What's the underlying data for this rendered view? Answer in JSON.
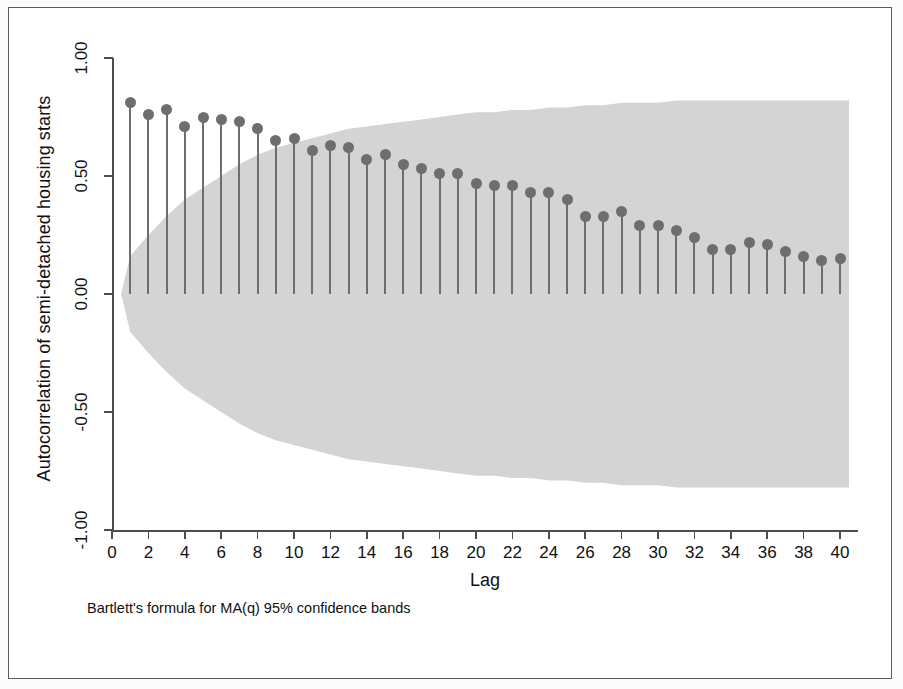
{
  "chart_data": {
    "type": "bar",
    "title": "",
    "xlabel": "Lag",
    "ylabel": "Autocorrelation of semi-detached housing starts",
    "note": "Bartlett's formula for MA(q) 95% confidence bands",
    "xlim": [
      0,
      41
    ],
    "ylim": [
      -1.0,
      1.0
    ],
    "grid": false,
    "legend": "none",
    "xticks": [
      0,
      2,
      4,
      6,
      8,
      10,
      12,
      14,
      16,
      18,
      20,
      22,
      24,
      26,
      28,
      30,
      32,
      34,
      36,
      38,
      40
    ],
    "xtick_labels": [
      "0",
      "2",
      "4",
      "6",
      "8",
      "10",
      "12",
      "14",
      "16",
      "18",
      "20",
      "22",
      "24",
      "26",
      "28",
      "30",
      "32",
      "34",
      "36",
      "38",
      "40"
    ],
    "yticks": [
      -1.0,
      -0.5,
      0.0,
      0.5,
      1.0
    ],
    "ytick_labels": [
      "-1.00",
      "-0.50",
      "0.00",
      "0.50",
      "1.00"
    ],
    "series_name": "autocorrelation",
    "categories": [
      1,
      2,
      3,
      4,
      5,
      6,
      7,
      8,
      9,
      10,
      11,
      12,
      13,
      14,
      15,
      16,
      17,
      18,
      19,
      20,
      21,
      22,
      23,
      24,
      25,
      26,
      27,
      28,
      29,
      30,
      31,
      32,
      33,
      34,
      35,
      36,
      37,
      38,
      39,
      40
    ],
    "values": [
      0.81,
      0.76,
      0.78,
      0.71,
      0.75,
      0.74,
      0.73,
      0.7,
      0.65,
      0.66,
      0.61,
      0.63,
      0.62,
      0.57,
      0.59,
      0.55,
      0.53,
      0.51,
      0.51,
      0.47,
      0.46,
      0.46,
      0.43,
      0.43,
      0.4,
      0.33,
      0.33,
      0.35,
      0.29,
      0.29,
      0.27,
      0.24,
      0.19,
      0.19,
      0.22,
      0.21,
      0.18,
      0.16,
      0.14,
      0.15
    ],
    "confidence_band": {
      "label": "95% confidence band",
      "color": "#d4d4d4",
      "upper": [
        0.16,
        0.25,
        0.33,
        0.4,
        0.45,
        0.5,
        0.55,
        0.59,
        0.62,
        0.64,
        0.66,
        0.68,
        0.7,
        0.71,
        0.72,
        0.73,
        0.74,
        0.75,
        0.76,
        0.77,
        0.77,
        0.78,
        0.78,
        0.79,
        0.79,
        0.8,
        0.8,
        0.81,
        0.81,
        0.81,
        0.82,
        0.82,
        0.82,
        0.82,
        0.82,
        0.82,
        0.82,
        0.82,
        0.82,
        0.82
      ],
      "lower": [
        -0.16,
        -0.25,
        -0.33,
        -0.4,
        -0.45,
        -0.5,
        -0.55,
        -0.59,
        -0.62,
        -0.64,
        -0.66,
        -0.68,
        -0.7,
        -0.71,
        -0.72,
        -0.73,
        -0.74,
        -0.75,
        -0.76,
        -0.77,
        -0.77,
        -0.78,
        -0.78,
        -0.79,
        -0.79,
        -0.8,
        -0.8,
        -0.81,
        -0.81,
        -0.81,
        -0.82,
        -0.82,
        -0.82,
        -0.82,
        -0.82,
        -0.82,
        -0.82,
        -0.82,
        -0.82,
        -0.82
      ]
    },
    "marker_color": "#6e6e6e",
    "stem_color": "#6e6e6e"
  }
}
